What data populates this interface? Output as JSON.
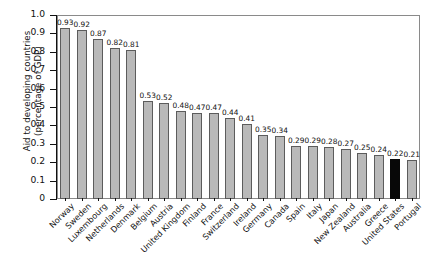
{
  "chart_data": {
    "type": "bar",
    "title": "",
    "subtitle": "",
    "xlabel": "",
    "ylabel": "Aid to developing countries\n(percentage of GDP)",
    "ylim": [
      0,
      1.0
    ],
    "ytick_labels": [
      "0",
      "0.1",
      "0.2",
      "0.3",
      "0.4",
      "0.5",
      "0.6",
      "0.7",
      "0.8",
      "0.9",
      "1.0"
    ],
    "ytick_values": [
      0,
      0.1,
      0.2,
      0.3,
      0.4,
      0.5,
      0.6,
      0.7,
      0.8,
      0.9,
      1.0
    ],
    "grid": false,
    "legend": null,
    "categories": [
      "Norway",
      "Sweden",
      "Luxembourg",
      "Netherlands",
      "Denmark",
      "Belgium",
      "Austria",
      "United Kingdom",
      "Finland",
      "France",
      "Switzerland",
      "Ireland",
      "Germany",
      "Canada",
      "Spain",
      "Italy",
      "Japan",
      "New Zealand",
      "Australia",
      "Greece",
      "United States",
      "Portugal"
    ],
    "values": [
      0.93,
      0.92,
      0.87,
      0.82,
      0.81,
      0.53,
      0.52,
      0.48,
      0.47,
      0.47,
      0.44,
      0.41,
      0.35,
      0.34,
      0.29,
      0.29,
      0.28,
      0.27,
      0.25,
      0.24,
      0.22,
      0.21
    ],
    "value_labels": [
      "0.93",
      "0.92",
      "0.87",
      "0.82",
      "0.81",
      "0.53",
      "0.52",
      "0.48",
      "0.47",
      "0.47",
      "0.44",
      "0.41",
      "0.35",
      "0.34",
      "0.29",
      "0.29",
      "0.28",
      "0.27",
      "0.25",
      "0.24",
      "0.22",
      "0.21"
    ],
    "highlighted_index": 20,
    "colors": {
      "bar_fill": "#b9b9b9",
      "bar_edge": "#5c5c5c",
      "highlight_fill": "#080808",
      "axis": "#111111",
      "frame": "#8a8a8a",
      "background": "#ffffff"
    }
  }
}
